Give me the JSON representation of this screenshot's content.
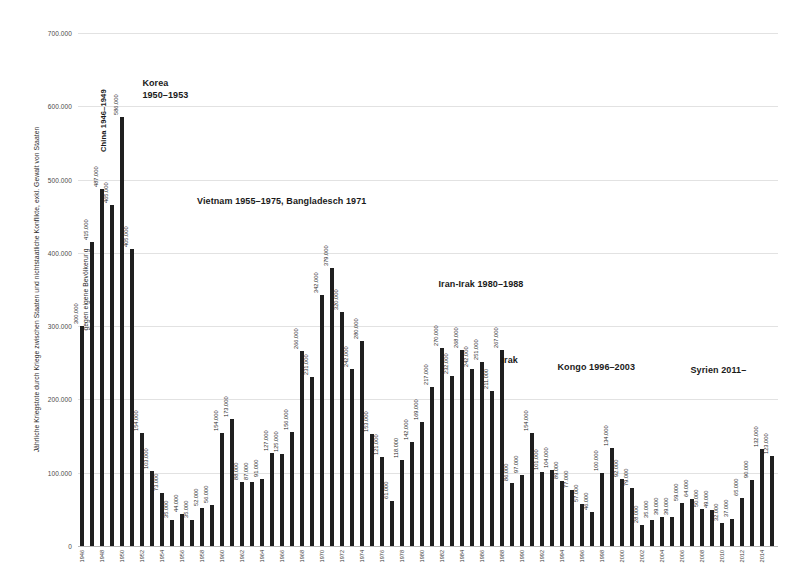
{
  "chart_data": {
    "type": "bar",
    "title": "",
    "xlabel": "",
    "ylabel": "Jährliche Kriegstote durch Kriege zwischen Staaten und nichtstaatliche Konflikte, exkl. Gewalt von Staaten gegen eigene Bevölkerung",
    "ylabel_line1": "Jährliche Kriegstote durch Kriege zwischen Staaten und nichtstaatliche Konflikte, exkl. Gewalt von Staaten",
    "ylabel_line2": "gegen eigene Bevölkerung",
    "ylim": [
      0,
      700000
    ],
    "ytick_values": [
      0,
      100000,
      200000,
      300000,
      400000,
      500000,
      600000,
      700000
    ],
    "ytick_labels": [
      "0",
      "100.000",
      "200.000",
      "300.000",
      "400.000",
      "500.000",
      "600.000",
      "700.000"
    ],
    "grid": true,
    "legend": "none",
    "bar_color": "#1f1f1f",
    "value_label_format": "dot-thousands",
    "categories": [
      1946,
      1947,
      1948,
      1949,
      1950,
      1951,
      1952,
      1953,
      1954,
      1955,
      1956,
      1957,
      1958,
      1959,
      1960,
      1961,
      1962,
      1963,
      1964,
      1965,
      1966,
      1967,
      1968,
      1969,
      1970,
      1971,
      1972,
      1973,
      1974,
      1975,
      1976,
      1977,
      1978,
      1979,
      1980,
      1981,
      1982,
      1983,
      1984,
      1985,
      1986,
      1987,
      1988,
      1989,
      1990,
      1991,
      1992,
      1993,
      1994,
      1995,
      1996,
      1997,
      1998,
      1999,
      2000,
      2001,
      2002,
      2003,
      2004,
      2005,
      2006,
      2007,
      2008,
      2009,
      2010,
      2011,
      2012,
      2013,
      2014,
      2015
    ],
    "xtick_labels": [
      "1946",
      "",
      "1948",
      "",
      "1950",
      "",
      "1952",
      "",
      "1954",
      "",
      "1956",
      "",
      "1958",
      "",
      "1960",
      "",
      "1962",
      "",
      "1964",
      "",
      "1966",
      "",
      "1968",
      "",
      "1970",
      "",
      "1972",
      "",
      "1974",
      "",
      "1976",
      "",
      "1978",
      "",
      "1980",
      "",
      "1982",
      "",
      "1984",
      "",
      "1986",
      "",
      "1988",
      "",
      "1990",
      "",
      "1992",
      "",
      "1994",
      "",
      "1996",
      "",
      "1998",
      "",
      "2000",
      "",
      "2002",
      "",
      "2004",
      "",
      "2006",
      "",
      "2008",
      "",
      "2010",
      "",
      "2012",
      "",
      "2014",
      ""
    ],
    "values": [
      300000,
      415000,
      487000,
      465000,
      586000,
      405000,
      154000,
      103000,
      73000,
      35000,
      44000,
      35000,
      52000,
      56000,
      154000,
      173000,
      88000,
      87000,
      91000,
      127000,
      125000,
      156000,
      266000,
      231000,
      342000,
      379000,
      320000,
      242000,
      280000,
      153000,
      121000,
      61000,
      118000,
      142000,
      169000,
      217000,
      270000,
      232000,
      268000,
      242000,
      251000,
      211000,
      267000,
      86000,
      97000,
      154000,
      101000,
      104000,
      89000,
      77000,
      57000,
      46000,
      100000,
      134000,
      92000,
      79000,
      28000,
      35000,
      39000,
      39000,
      59000,
      64000,
      50000,
      49000,
      32000,
      37000,
      65000,
      90000,
      132000,
      123000
    ],
    "value_labels": [
      "300.000",
      "415.000",
      "487.000",
      "465.000",
      "586.000",
      "405.000",
      "154.000",
      "103.000",
      "73.000",
      "35.000",
      "44.000",
      "35.000",
      "52.000",
      "56.000",
      "154.000",
      "173.000",
      "88.000",
      "87.000",
      "91.000",
      "127.000",
      "125.000",
      "156.000",
      "266.000",
      "231.000",
      "342.000",
      "379.000",
      "320.000",
      "242.000",
      "280.000",
      "153.000",
      "121.000",
      "61.000",
      "118.000",
      "142.000",
      "169.000",
      "217.000",
      "270.000",
      "232.000",
      "268.000",
      "242.000",
      "251.000",
      "211.000",
      "267.000",
      "86.000",
      "97.000",
      "154.000",
      "101.000",
      "104.000",
      "89.000",
      "77.000",
      "57.000",
      "46.000",
      "100.000",
      "134.000",
      "92.000",
      "79.000",
      "28.000",
      "35.000",
      "39.000",
      "39.000",
      "59.000",
      "64.000",
      "50.000",
      "49.000",
      "32.000",
      "37.000",
      "65.000",
      "90.000",
      "132.000",
      "123.000"
    ],
    "annotations": [
      {
        "id": "china",
        "text": "China 1946–1949",
        "style": "rotated",
        "x_pct": 4.3,
        "y_pct": 21.5
      },
      {
        "id": "korea",
        "text_line1": "Korea",
        "text_line2": "1950–1953",
        "style": "block",
        "x_pct": 9.2,
        "y_pct": 8.5
      },
      {
        "id": "vietnam",
        "text": "Vietnam 1955–1975, Bangladesch 1971",
        "style": "block",
        "x_pct": 17.0,
        "y_pct": 31.5
      },
      {
        "id": "iran-irak",
        "text": "Iran-Irak 1980–1988",
        "style": "block",
        "x_pct": 51.5,
        "y_pct": 47.8
      },
      {
        "id": "irak",
        "text": "Irak",
        "style": "block",
        "x_pct": 60.5,
        "y_pct": 62.5
      },
      {
        "id": "kongo",
        "text": "Kongo 1996–2003",
        "style": "block",
        "x_pct": 68.5,
        "y_pct": 64.0
      },
      {
        "id": "syrien",
        "text": "Syrien 2011–",
        "style": "block",
        "x_pct": 87.5,
        "y_pct": 64.5
      }
    ]
  }
}
